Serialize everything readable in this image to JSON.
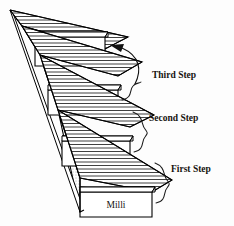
{
  "figure": {
    "background_color": "#fdfdfd",
    "line_color": "#000000",
    "text_color": "#14110f"
  },
  "steps": [
    {
      "id": "base-unit",
      "label": "Base Unit",
      "label_line1": "Base",
      "label_line2": "Unit",
      "position": "top"
    },
    {
      "id": "deci",
      "label": "Deci",
      "label_line1": "Deci",
      "label_line2": "",
      "position": "second"
    },
    {
      "id": "centi",
      "label": "Centi",
      "label_line1": "Centi",
      "label_line2": "",
      "position": "third"
    },
    {
      "id": "milli",
      "label": "Milli",
      "label_line1": "Milli",
      "label_line2": "",
      "position": "bottom"
    }
  ],
  "brackets": [
    {
      "id": "third-step",
      "label": "Third Step",
      "spans": "Deci to Base Unit"
    },
    {
      "id": "second-step",
      "label": "Second Step",
      "spans": "Centi to Deci"
    },
    {
      "id": "first-step",
      "label": "First Step",
      "spans": "Milli to Centi"
    }
  ],
  "arrow": {
    "id": "base-unit-arrow",
    "icon": "curved-arrow-icon",
    "points_to": "Base Unit"
  }
}
